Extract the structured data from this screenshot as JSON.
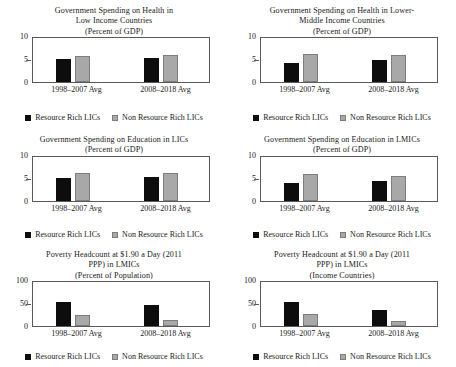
{
  "legend": {
    "series": [
      {
        "label": "Resource Rich LICs",
        "color": "#0d0d0d",
        "swatch": "square-black-icon"
      },
      {
        "label": "Non Resource Rich LICs",
        "color": "#a8a8a8",
        "swatch": "square-gray-icon"
      }
    ]
  },
  "categories": [
    "1998–2007 Avg",
    "2008–2018 Avg"
  ],
  "chart_data": [
    {
      "type": "bar",
      "id": "health-lic",
      "title": "Government Spending on Health in\nLow Income Countries\n(Percent of GDP)",
      "title_lines": [
        "Government Spending on Health in",
        "Low Income Countries",
        "(Percent of GDP)"
      ],
      "xlabel": "",
      "ylabel": "",
      "ylim": [
        0,
        10
      ],
      "yticks": [
        0,
        5,
        10
      ],
      "ytick_labels": [
        "0",
        "5",
        "10"
      ],
      "grid": false,
      "legend_position": "bottom",
      "categories": [
        "1998–2007 Avg",
        "2008–2018 Avg"
      ],
      "series": [
        {
          "name": "Resource Rich LICs",
          "values": [
            5.2,
            5.6
          ]
        },
        {
          "name": "Non Resource Rich LICs",
          "values": [
            6.0,
            6.2
          ]
        }
      ]
    },
    {
      "type": "bar",
      "id": "health-lmic",
      "title": "Government Spending on Health in Lower-\nMiddle Income Countries\n(Percent of GDP)",
      "title_lines": [
        "Government Spending on Health in Lower-",
        "Middle Income Countries",
        "(Percent of GDP)"
      ],
      "xlabel": "",
      "ylabel": "",
      "ylim": [
        0,
        10
      ],
      "yticks": [
        0,
        5,
        10
      ],
      "ytick_labels": [
        "0",
        "5",
        "10"
      ],
      "grid": false,
      "legend_position": "bottom",
      "categories": [
        "1998–2007 Avg",
        "2008–2018 Avg"
      ],
      "series": [
        {
          "name": "Resource Rich LICs",
          "values": [
            4.4,
            5.0
          ]
        },
        {
          "name": "Non Resource Rich LICs",
          "values": [
            6.5,
            6.3
          ]
        }
      ]
    },
    {
      "type": "bar",
      "id": "education-lic",
      "title": "Government Spending on Education in LICs\n(Percent of GDP)",
      "title_lines": [
        "Government Spending on Education in LICs",
        "(Percent of GDP)"
      ],
      "xlabel": "",
      "ylabel": "",
      "ylim": [
        0,
        10
      ],
      "yticks": [
        0,
        5,
        10
      ],
      "ytick_labels": [
        "0",
        "5",
        "10"
      ],
      "grid": false,
      "legend_position": "bottom",
      "categories": [
        "1998–2007 Avg",
        "2008–2018 Avg"
      ],
      "series": [
        {
          "name": "Resource Rich LICs",
          "values": [
            5.2,
            5.5
          ]
        },
        {
          "name": "Non Resource Rich LICs",
          "values": [
            6.4,
            6.4
          ]
        }
      ]
    },
    {
      "type": "bar",
      "id": "education-lmic",
      "title": "Government Spending on Education in LMICs\n(Percent of GDP)",
      "title_lines": [
        "Government Spending on Education in LMICs",
        "(Percent of GDP)"
      ],
      "xlabel": "",
      "ylabel": "",
      "ylim": [
        0,
        10
      ],
      "yticks": [
        0,
        5,
        10
      ],
      "ytick_labels": [
        "0",
        "5",
        "10"
      ],
      "grid": false,
      "legend_position": "bottom",
      "categories": [
        "1998–2007 Avg",
        "2008–2018 Avg"
      ],
      "series": [
        {
          "name": "Resource Rich LICs",
          "values": [
            4.1,
            4.6
          ]
        },
        {
          "name": "Non Resource Rich LICs",
          "values": [
            6.0,
            5.6
          ]
        }
      ]
    },
    {
      "type": "bar",
      "id": "poverty-lmic-population",
      "title": "Poverty Headcount at $1.90 a Day (2011\nPPP) in LMICs\n(Percent of Population)",
      "title_lines": [
        "Poverty Headcount at $1.90 a Day (2011",
        "PPP) in LMICs",
        "(Percent of Population)"
      ],
      "xlabel": "",
      "ylabel": "",
      "ylim": [
        0,
        100
      ],
      "yticks": [
        0,
        50,
        100
      ],
      "ytick_labels": [
        "0",
        "50",
        "100"
      ],
      "grid": false,
      "legend_position": "bottom",
      "categories": [
        "1998–2007 Avg",
        "2008–2018 Avg"
      ],
      "series": [
        {
          "name": "Resource Rich LICs",
          "values": [
            56,
            49
          ]
        },
        {
          "name": "Non Resource Rich LICs",
          "values": [
            25,
            15
          ]
        }
      ]
    },
    {
      "type": "bar",
      "id": "poverty-lmic-income",
      "title": "Poverty Headcount at $1.90 a Day (2011\nPPP) in LMICs\n(Income Countries)",
      "title_lines": [
        "Poverty Headcount at $1.90 a Day (2011",
        "PPP) in LMICs",
        "(Income Countries)"
      ],
      "xlabel": "",
      "ylabel": "",
      "ylim": [
        0,
        100
      ],
      "yticks": [
        0,
        50,
        100
      ],
      "ytick_labels": [
        "0",
        "50",
        "100"
      ],
      "grid": false,
      "legend_position": "bottom",
      "categories": [
        "1998–2007 Avg",
        "2008–2018 Avg"
      ],
      "series": [
        {
          "name": "Resource Rich LICs",
          "values": [
            56,
            38
          ]
        },
        {
          "name": "Non Resource Rich LICs",
          "values": [
            27,
            12
          ]
        }
      ]
    }
  ]
}
